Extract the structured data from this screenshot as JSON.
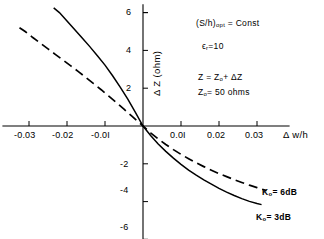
{
  "chart_data": {
    "type": "line",
    "title": "",
    "xlabel": "Δ w/h",
    "ylabel": "Δ Z (ohm)",
    "xlim": [
      -0.037,
      0.037
    ],
    "ylim": [
      -6.5,
      6.5
    ],
    "grid": false,
    "legend_position": "inline-right",
    "xticks": [
      -0.03,
      -0.02,
      -0.01,
      0.01,
      0.02,
      0.03
    ],
    "xticklabels": [
      "-0.03",
      "-0.02",
      "-0.0I",
      "0.0I",
      "0.02",
      "0.03"
    ],
    "yticks": [
      6,
      4,
      2,
      -2,
      -4,
      -6
    ],
    "yticklabels": [
      "6",
      "4",
      "2",
      "-2",
      "-4",
      "-6"
    ],
    "series": [
      {
        "name": "K₀ = 3dB",
        "style": "solid",
        "label": "K₀ = 3dB",
        "x": [
          -0.0235,
          -0.022,
          -0.02,
          -0.018,
          -0.016,
          -0.014,
          -0.012,
          -0.01,
          -0.008,
          -0.006,
          -0.004,
          -0.002,
          0.0,
          0.002,
          0.004,
          0.006,
          0.008,
          0.01,
          0.012,
          0.014,
          0.016,
          0.018,
          0.02,
          0.022,
          0.024,
          0.026,
          0.028,
          0.03,
          0.0312
        ],
        "y": [
          6.25,
          6.0,
          5.55,
          5.1,
          4.65,
          4.2,
          3.72,
          3.22,
          2.66,
          2.06,
          1.42,
          0.72,
          0.0,
          -0.5,
          -0.95,
          -1.34,
          -1.7,
          -2.03,
          -2.33,
          -2.6,
          -2.85,
          -3.08,
          -3.3,
          -3.5,
          -3.68,
          -3.84,
          -3.99,
          -4.1,
          -4.16
        ]
      },
      {
        "name": "K₀ = 6dB",
        "style": "dashed",
        "label": "K₀ = 6dB",
        "x": [
          -0.0325,
          -0.031,
          -0.029,
          -0.027,
          -0.025,
          -0.023,
          -0.021,
          -0.019,
          -0.017,
          -0.015,
          -0.013,
          -0.011,
          -0.009,
          -0.007,
          -0.005,
          -0.003,
          -0.001,
          0.0,
          0.002,
          0.004,
          0.006,
          0.008,
          0.01,
          0.012,
          0.014,
          0.016,
          0.018,
          0.02,
          0.022,
          0.024,
          0.026,
          0.028,
          0.03,
          0.0325
        ],
        "y": [
          5.2,
          5.0,
          4.68,
          4.38,
          4.08,
          3.78,
          3.48,
          3.18,
          2.88,
          2.56,
          2.24,
          1.92,
          1.58,
          1.24,
          0.89,
          0.53,
          0.18,
          0.0,
          -0.36,
          -0.68,
          -0.98,
          -1.25,
          -1.5,
          -1.73,
          -1.95,
          -2.15,
          -2.34,
          -2.52,
          -2.68,
          -2.84,
          -2.99,
          -3.13,
          -3.26,
          -3.42
        ]
      }
    ],
    "annotations": [
      {
        "id": "s-over-h",
        "text_main": "(S/h)",
        "text_sub": "opt",
        "text_tail": "= Const"
      },
      {
        "id": "epsilon-r",
        "text_main": "ε",
        "text_sub": "r",
        "text_tail": "=10"
      },
      {
        "id": "z-equation",
        "text": "Z = Z₀ + ΔZ"
      },
      {
        "id": "z-zero-value",
        "text": "Z₀ = 50  ohms"
      }
    ]
  },
  "axes": {
    "x_title": "Δ w/h",
    "y_title": "Δ Z (ohm)"
  },
  "ticks": {
    "x": [
      "-0.03",
      "-0.02",
      "-0.0I",
      "0.0I",
      "0.02",
      "0.03"
    ],
    "y": [
      "6",
      "4",
      "2",
      "-2",
      "-4",
      "-6"
    ]
  },
  "annotations": {
    "sh_main": "(S/h)",
    "sh_sub": "opt",
    "sh_tail": "= Const",
    "eps_main": "ϵ",
    "eps_sub": "r",
    "eps_tail": "=10",
    "z_eq_a": "Z = Z",
    "z_eq_a_sub": "o",
    "z_eq_a_tail": "+ ΔZ",
    "z_eq_b": "Z",
    "z_eq_b_sub": "o",
    "z_eq_b_tail": "= 50  ohms"
  },
  "curve_labels": {
    "k6_main": "K",
    "k6_sub": "o",
    "k6_tail": "= 6dB",
    "k3_main": "K",
    "k3_sub": "o",
    "k3_tail": "= 3dB"
  },
  "colors": {
    "ink": "#000000",
    "background": "#ffffff"
  }
}
